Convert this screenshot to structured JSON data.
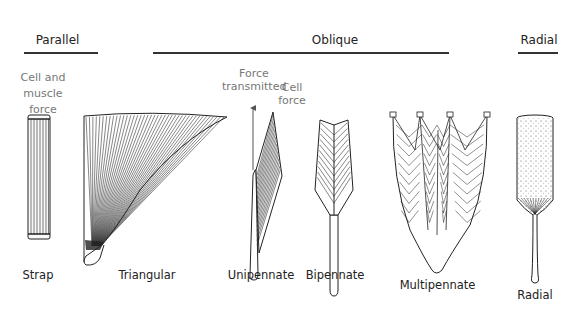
{
  "categories": [
    {
      "label": "Parallel"
    },
    {
      "label": "Oblique"
    },
    {
      "label": "Radial"
    }
  ],
  "annotations": {
    "cell_muscle_force": [
      "Cell and",
      "muscle",
      "force"
    ],
    "force_transmitted": [
      "Force",
      "transmitted"
    ],
    "cell_force": [
      "Cell",
      "force"
    ]
  },
  "shapes": [
    {
      "label": "Strap",
      "category": "Parallel"
    },
    {
      "label": "Triangular",
      "category": "Oblique"
    },
    {
      "label": "Unipennate",
      "category": "Oblique"
    },
    {
      "label": "Bipennate",
      "category": "Oblique"
    },
    {
      "label": "Multipennate",
      "category": "Oblique"
    },
    {
      "label": "Radial",
      "category": "Radial"
    }
  ],
  "colors": {
    "ink": "#222222",
    "annotation": "#777777",
    "arrow": "#555555"
  }
}
